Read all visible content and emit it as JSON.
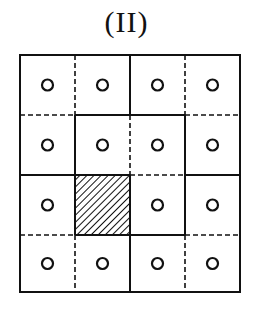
{
  "figure": {
    "label": "(II)",
    "grid": {
      "rows": 4,
      "cols": 4,
      "x_lines": [
        20,
        75,
        130,
        185,
        240
      ],
      "y_lines": [
        55,
        115,
        175,
        235,
        292
      ],
      "stroke_color": "#111111",
      "hatched_cell": {
        "row": 3,
        "col": 2
      },
      "cells": [
        [
          "circle",
          "circle",
          "circle",
          "circle"
        ],
        [
          "circle",
          "circle",
          "circle",
          "circle"
        ],
        [
          "circle",
          "hatched",
          "circle",
          "circle"
        ],
        [
          "circle",
          "circle",
          "circle",
          "circle"
        ]
      ],
      "horizontal_edges": {
        "y115": [
          "dashed",
          "solid",
          "solid",
          "dashed"
        ],
        "y175": [
          "solid",
          "solid",
          "dashed",
          "solid"
        ],
        "y235": [
          "dashed",
          "solid",
          "solid",
          "dashed"
        ]
      },
      "vertical_edges": {
        "x75": [
          "dashed",
          "solid",
          "solid",
          "dashed"
        ],
        "x130": [
          "solid",
          "dashed",
          "solid",
          "solid"
        ],
        "x185": [
          "dashed",
          "solid",
          "solid",
          "dashed"
        ]
      }
    }
  }
}
